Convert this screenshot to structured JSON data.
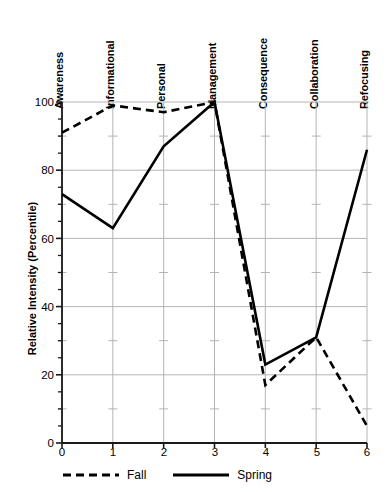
{
  "chart_data": {
    "type": "line",
    "title": "",
    "xlabel": "",
    "ylabel": "Relative Intensity (Percentile)",
    "xlim": [
      0,
      6
    ],
    "ylim": [
      0,
      100
    ],
    "grid": true,
    "legend_position": "bottom-left",
    "x": [
      0,
      1,
      2,
      3,
      4,
      5,
      6
    ],
    "categories": [
      "Awareness",
      "Informational",
      "Personal",
      "Management",
      "Consequence",
      "Collaboration",
      "Refocusing"
    ],
    "xtick_labels": [
      "0",
      "1",
      "2",
      "3",
      "4",
      "5",
      "6"
    ],
    "ytick_labels": [
      "0",
      "20",
      "40",
      "60",
      "80",
      "100"
    ],
    "ytick_values": [
      0,
      20,
      40,
      60,
      80,
      100
    ],
    "yminor_step": 5,
    "series": [
      {
        "name": "Fall",
        "style": "dashed",
        "color": "#000000",
        "values": [
          91,
          99,
          97,
          100,
          17,
          31,
          5
        ]
      },
      {
        "name": "Spring",
        "style": "solid",
        "color": "#000000",
        "values": [
          73,
          63,
          87,
          100,
          23,
          31,
          86
        ]
      }
    ]
  },
  "colors": {
    "axis": "#1a1a1a",
    "grid": "#b4b4b4",
    "line": "#000000",
    "background": "#ffffff"
  }
}
